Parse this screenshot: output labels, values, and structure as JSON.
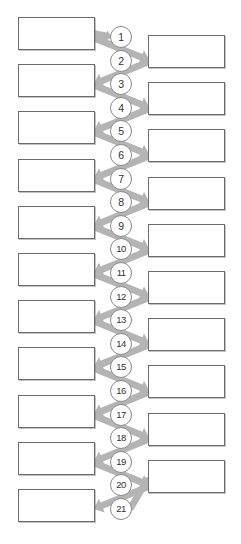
{
  "diagram": {
    "colors": {
      "box_border": "#6b6b6b",
      "box_fill": "#ffffff",
      "circle_border": "#8a8a8a",
      "circle_fill": "#ffffff",
      "connector": "#b4b4b4",
      "label_text": "#333333",
      "background": "#ffffff"
    },
    "geometry": {
      "width": 241,
      "height": 544,
      "left_column": {
        "x": 18,
        "width": 77,
        "height": 33,
        "first_y": 17,
        "pitch": 47.2,
        "count": 11
      },
      "right_column": {
        "x": 148,
        "width": 77,
        "height": 33,
        "first_y": 35,
        "pitch": 47.2,
        "count": 10
      },
      "circles": {
        "cx": 121,
        "r": 11,
        "first_cy": 37,
        "pitch": 23.6,
        "count": 21
      }
    },
    "left_boxes": [
      {
        "id": "left-box-1",
        "label": ""
      },
      {
        "id": "left-box-2",
        "label": ""
      },
      {
        "id": "left-box-3",
        "label": ""
      },
      {
        "id": "left-box-4",
        "label": ""
      },
      {
        "id": "left-box-5",
        "label": ""
      },
      {
        "id": "left-box-6",
        "label": ""
      },
      {
        "id": "left-box-7",
        "label": ""
      },
      {
        "id": "left-box-8",
        "label": ""
      },
      {
        "id": "left-box-9",
        "label": ""
      },
      {
        "id": "left-box-10",
        "label": ""
      },
      {
        "id": "left-box-11",
        "label": ""
      }
    ],
    "right_boxes": [
      {
        "id": "right-box-1",
        "label": ""
      },
      {
        "id": "right-box-2",
        "label": ""
      },
      {
        "id": "right-box-3",
        "label": ""
      },
      {
        "id": "right-box-4",
        "label": ""
      },
      {
        "id": "right-box-5",
        "label": ""
      },
      {
        "id": "right-box-6",
        "label": ""
      },
      {
        "id": "right-box-7",
        "label": ""
      },
      {
        "id": "right-box-8",
        "label": ""
      },
      {
        "id": "right-box-9",
        "label": ""
      },
      {
        "id": "right-box-10",
        "label": ""
      }
    ],
    "step_numbers": [
      "1",
      "2",
      "3",
      "4",
      "5",
      "6",
      "7",
      "8",
      "9",
      "10",
      "11",
      "12",
      "13",
      "14",
      "15",
      "16",
      "17",
      "18",
      "19",
      "20",
      "21"
    ]
  }
}
